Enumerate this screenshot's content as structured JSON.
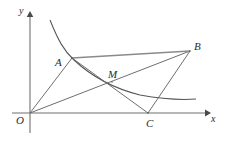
{
  "figure": {
    "background_color": "#ffffff",
    "stroke_color": "#666666",
    "axis_color": "#707070",
    "curve_color": "#555555",
    "label_color": "#2b2b2b",
    "width": 228,
    "height": 141
  },
  "axes": {
    "x_axis": {
      "label": "x",
      "name": "x-axis",
      "start": [
        12,
        113
      ],
      "end": [
        208,
        113
      ],
      "arrow": true
    },
    "y_axis": {
      "label": "y",
      "name": "y-axis",
      "start": [
        30,
        133
      ],
      "end": [
        30,
        13
      ],
      "arrow": true
    },
    "origin": {
      "label": "O",
      "point": [
        30,
        113
      ]
    }
  },
  "points": [
    {
      "id": "A",
      "label": "A",
      "x": 72,
      "y": 58,
      "description": "on hyperbola, upper-left vertex"
    },
    {
      "id": "B",
      "label": "B",
      "x": 190,
      "y": 51,
      "description": "upper-right vertex"
    },
    {
      "id": "C",
      "label": "C",
      "x": 148,
      "y": 113,
      "description": "on x-axis, lower-right vertex"
    },
    {
      "id": "M",
      "label": "M",
      "x": 112,
      "y": 82,
      "description": "intersection of OB and AC"
    }
  ],
  "segments": [
    {
      "id": "OA",
      "from": "O",
      "to": "A",
      "name": "segment-OA"
    },
    {
      "id": "OB",
      "from": "O",
      "to": "B",
      "name": "segment-OB"
    },
    {
      "id": "AB",
      "from": "A",
      "to": "B",
      "name": "segment-AB"
    },
    {
      "id": "AC",
      "from": "A",
      "to": "C",
      "name": "segment-AC"
    },
    {
      "id": "BC",
      "from": "B",
      "to": "C",
      "name": "segment-BC"
    }
  ],
  "curve": {
    "name": "hyperbola-branch",
    "type": "reciprocal",
    "description": "Decreasing branch of an inverse-proportion curve in the first quadrant, passing through A",
    "path": "M 50 20 C 58 40, 64 51, 74 60 C 90 75, 112 88, 140 95 C 162 99, 182 100, 196 99"
  },
  "labels": {
    "A": "A",
    "B": "B",
    "C": "C",
    "M": "M",
    "O": "O",
    "x": "x",
    "y": "y"
  }
}
